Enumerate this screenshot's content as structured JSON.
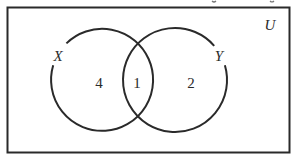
{
  "diagram": {
    "type": "venn",
    "universe": {
      "label": "U"
    },
    "sets": [
      {
        "id": "X",
        "label": "X"
      },
      {
        "id": "Y",
        "label": "Y"
      }
    ],
    "regions": {
      "x_only": "4",
      "x_and_y": "1",
      "y_only": "2"
    },
    "colors": {
      "stroke": "#2a2a2a",
      "background": "#ffffff"
    }
  }
}
